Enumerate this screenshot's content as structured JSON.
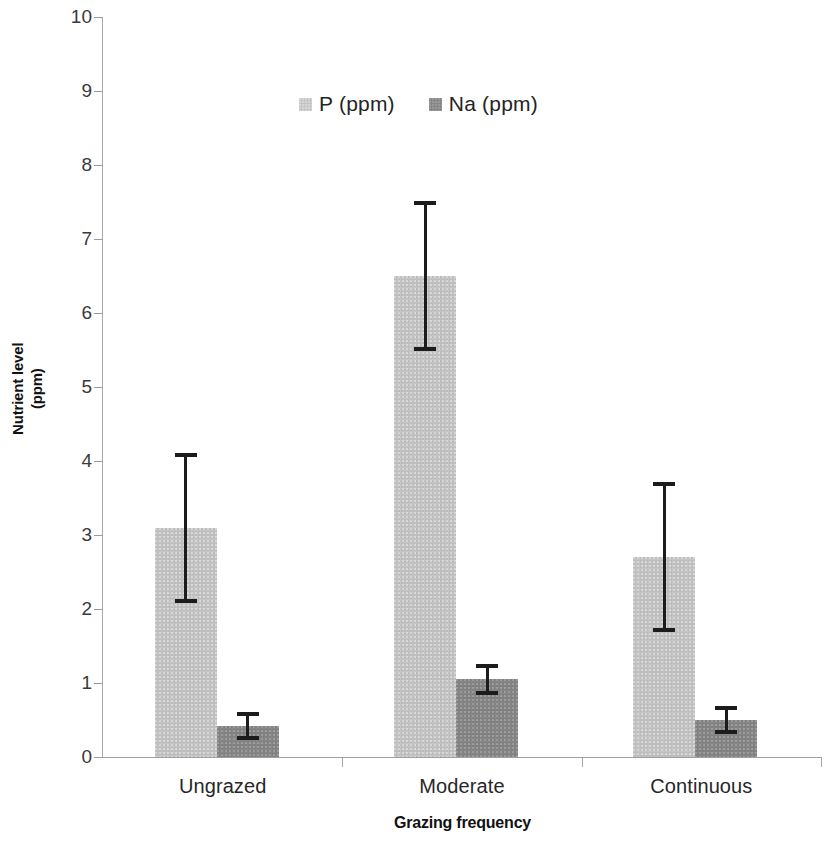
{
  "chart_data": {
    "type": "bar",
    "title": "",
    "xlabel": "Grazing frequency",
    "ylabel": "Nutrient level (ppm)",
    "ylabel_lines": [
      "Nutrient level",
      "(ppm)"
    ],
    "categories": [
      "Ungrazed",
      "Moderate",
      "Continuous"
    ],
    "series": [
      {
        "name": "P (ppm)",
        "color": "#c4c4c4",
        "values": [
          3.1,
          6.5,
          2.7
        ],
        "errors": [
          1.0,
          1.0,
          1.0
        ],
        "error_upper": [
          4.1,
          7.5,
          3.7
        ],
        "error_lower": [
          2.1,
          5.5,
          1.7
        ]
      },
      {
        "name": "Na (ppm)",
        "color": "#868686",
        "values": [
          0.42,
          1.05,
          0.5
        ],
        "errors": [
          0.18,
          0.2,
          0.18
        ],
        "error_upper": [
          0.6,
          1.25,
          0.68
        ],
        "error_lower": [
          0.24,
          0.85,
          0.32
        ]
      }
    ],
    "ylim": [
      0,
      10
    ],
    "ytick_labels": [
      "0",
      "1",
      "2",
      "3",
      "4",
      "5",
      "6",
      "7",
      "8",
      "9",
      "10"
    ],
    "ytick_values": [
      0,
      1,
      2,
      3,
      4,
      5,
      6,
      7,
      8,
      9,
      10
    ],
    "grid": false,
    "legend_position": "top-center",
    "error_bar_style": "capped-vertical",
    "error_bar_color": "#1c1c1c"
  },
  "legend": {
    "entries": [
      {
        "label": "P (ppm)",
        "swatch": "series-p"
      },
      {
        "label": "Na (ppm)",
        "swatch": "series-na"
      }
    ]
  },
  "axes": {
    "y_title_line1": "Nutrient level",
    "y_title_line2": "(ppm)",
    "x_title": "Grazing frequency"
  }
}
